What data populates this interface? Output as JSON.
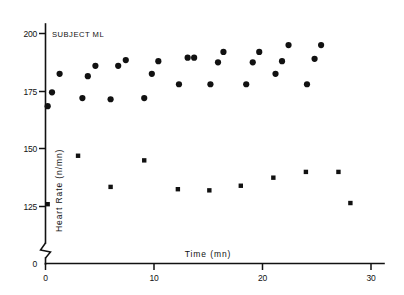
{
  "figure": {
    "title": "SUBJECT ML",
    "background_color": "#ffffff",
    "ink_color": "#111111"
  },
  "chart_data": {
    "type": "scatter",
    "title": "SUBJECT ML",
    "subtitle": "",
    "xlabel": "Time  (mn)",
    "ylabel": "Heart  Rate  (n/mn)",
    "xlim": [
      0,
      31
    ],
    "ylim": [
      118,
      203
    ],
    "y_axis_broken": true,
    "y_break_note": "axis break between 0 and 118",
    "grid": false,
    "legend": "none",
    "xticks": [
      0,
      10,
      20,
      30
    ],
    "xtick_labels": [
      "0",
      "10",
      "20",
      "30"
    ],
    "yticks": [
      125,
      150,
      175,
      200
    ],
    "ytick_labels": [
      "125",
      "150",
      "175",
      "200"
    ],
    "y_origin_label": "0",
    "x_origin_label": "0",
    "series": [
      {
        "name": "upper-series",
        "marker": "filled-circle",
        "marker_size_px": 3.1,
        "color": "#111111",
        "points": [
          {
            "x": 0.2,
            "y": 168.5
          },
          {
            "x": 0.6,
            "y": 174.5
          },
          {
            "x": 1.3,
            "y": 182.5
          },
          {
            "x": 3.4,
            "y": 172.0
          },
          {
            "x": 3.9,
            "y": 181.5
          },
          {
            "x": 4.6,
            "y": 186.0
          },
          {
            "x": 6.0,
            "y": 171.5
          },
          {
            "x": 6.7,
            "y": 186.0
          },
          {
            "x": 7.4,
            "y": 188.5
          },
          {
            "x": 9.1,
            "y": 172.0
          },
          {
            "x": 9.8,
            "y": 182.5
          },
          {
            "x": 10.4,
            "y": 188.0
          },
          {
            "x": 12.3,
            "y": 178.0
          },
          {
            "x": 13.1,
            "y": 189.5
          },
          {
            "x": 13.7,
            "y": 189.5
          },
          {
            "x": 15.2,
            "y": 178.0
          },
          {
            "x": 15.9,
            "y": 187.5
          },
          {
            "x": 16.4,
            "y": 192.0
          },
          {
            "x": 18.5,
            "y": 178.0
          },
          {
            "x": 19.1,
            "y": 187.5
          },
          {
            "x": 19.7,
            "y": 192.0
          },
          {
            "x": 21.2,
            "y": 182.5
          },
          {
            "x": 21.8,
            "y": 188.0
          },
          {
            "x": 22.4,
            "y": 195.0
          },
          {
            "x": 24.1,
            "y": 178.0
          },
          {
            "x": 24.8,
            "y": 189.0
          },
          {
            "x": 25.4,
            "y": 195.0
          }
        ]
      },
      {
        "name": "lower-series",
        "marker": "small-square",
        "marker_size_px": 2.2,
        "color": "#111111",
        "points": [
          {
            "x": 0.2,
            "y": 126.0
          },
          {
            "x": 3.0,
            "y": 147.0
          },
          {
            "x": 6.0,
            "y": 133.5
          },
          {
            "x": 9.1,
            "y": 145.0
          },
          {
            "x": 12.2,
            "y": 132.5
          },
          {
            "x": 15.1,
            "y": 132.0
          },
          {
            "x": 18.0,
            "y": 134.0
          },
          {
            "x": 21.0,
            "y": 137.5
          },
          {
            "x": 24.0,
            "y": 140.0
          },
          {
            "x": 27.0,
            "y": 140.0
          },
          {
            "x": 28.1,
            "y": 126.5
          }
        ]
      }
    ]
  }
}
